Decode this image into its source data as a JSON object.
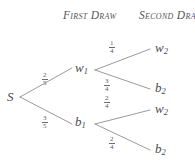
{
  "diagram": {
    "headers": {
      "first": "First Draw",
      "second": "Second Draw"
    },
    "root": {
      "label": "S"
    },
    "nodes": {
      "w1": {
        "base": "w",
        "sub": "1"
      },
      "b1": {
        "base": "b",
        "sub": "1"
      },
      "w2_top": {
        "base": "w",
        "sub": "2"
      },
      "b2_upper": {
        "base": "b",
        "sub": "2"
      },
      "w2_lower": {
        "base": "w",
        "sub": "2"
      },
      "b2_bottom": {
        "base": "b",
        "sub": "2"
      }
    },
    "edge_labels": {
      "s_to_w1": {
        "num": "2",
        "den": "5"
      },
      "s_to_b1": {
        "num": "3",
        "den": "5"
      },
      "w1_to_w2": {
        "num": "1",
        "den": "4"
      },
      "w1_to_b2": {
        "num": "3",
        "den": "4"
      },
      "b1_to_w2": {
        "num": "2",
        "den": "4"
      },
      "b1_to_b2": {
        "num": "2",
        "den": "4"
      }
    },
    "colors": {
      "line": "#8a8a8f",
      "text": "#55555a",
      "background": "#ffffff"
    }
  }
}
